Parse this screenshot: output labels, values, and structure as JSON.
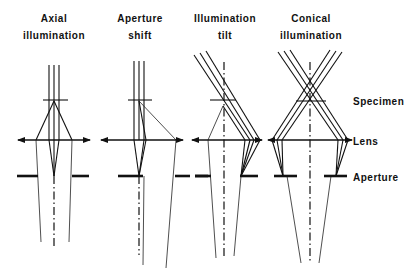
{
  "titles": [
    {
      "line1": "Axial",
      "line2": "illumination"
    },
    {
      "line1": "Aperture",
      "line2": "shift"
    },
    {
      "line1": "Illumination",
      "line2": "tilt"
    },
    {
      "line1": "Conical",
      "line2": "illumination"
    }
  ],
  "labels": {
    "specimen": "Specimen",
    "lens": "Lens",
    "aperture": "Aperture"
  },
  "colors": {
    "line": "#111111",
    "background": "#ffffff"
  }
}
